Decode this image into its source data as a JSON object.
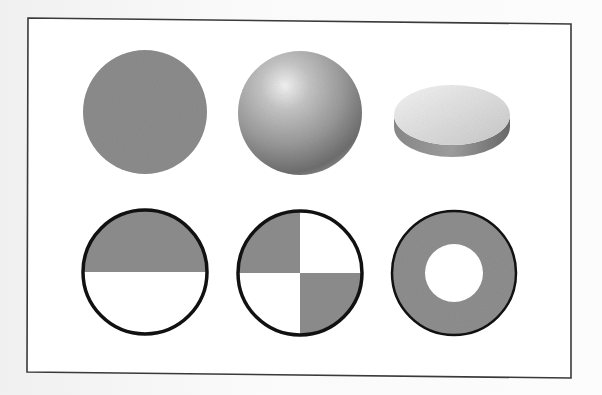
{
  "figure": {
    "frame": {
      "corners": [
        [
          28,
          18
        ],
        [
          571,
          24
        ],
        [
          571,
          378
        ],
        [
          27,
          372
        ]
      ],
      "stroke": "#3a3a3a"
    },
    "colors": {
      "fill_gray": "#8a8a8a",
      "outline": "#111111",
      "white": "#ffffff"
    },
    "top_row": [
      {
        "id": "flat-circle",
        "label": "",
        "cx": 145,
        "cy": 112,
        "r": 62
      },
      {
        "id": "shaded-sphere",
        "label": "",
        "cx": 300,
        "cy": 113,
        "r": 62
      },
      {
        "id": "flat-disc",
        "label": "",
        "cx": 452,
        "cy": 115,
        "rx": 58,
        "ry": 30,
        "thickness": 12
      }
    ],
    "bottom_row": [
      {
        "id": "half-filled-circle",
        "label": "",
        "cx": 145,
        "cy": 272,
        "r": 62,
        "pattern": "top-half-gray"
      },
      {
        "id": "quartered-circle",
        "label": "",
        "cx": 300,
        "cy": 273,
        "r": 62,
        "pattern": "quadrants-tl-br-gray"
      },
      {
        "id": "ring",
        "label": "",
        "cx": 454,
        "cy": 273,
        "r": 62,
        "inner_r": 29,
        "pattern": "annulus-gray"
      }
    ]
  }
}
